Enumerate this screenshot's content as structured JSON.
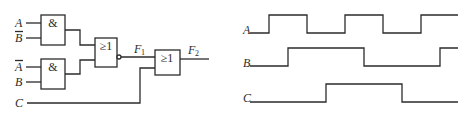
{
  "circuit": {
    "inputs": {
      "and1_top": {
        "label": "A",
        "inverted": false
      },
      "and1_bottom": {
        "label": "B",
        "inverted": true
      },
      "and2_top": {
        "label": "A",
        "inverted": true
      },
      "and2_bottom": {
        "label": "B",
        "inverted": false
      },
      "c_input": {
        "label": "C",
        "inverted": false
      }
    },
    "gates": {
      "and1": {
        "symbol": "&"
      },
      "and2": {
        "symbol": "&"
      },
      "nor": {
        "symbol": "≥1",
        "output_inverted": true
      },
      "or": {
        "symbol": "≥1"
      }
    },
    "outputs": {
      "f1": {
        "label": "F",
        "subscript": "1"
      },
      "f2": {
        "label": "F",
        "subscript": "2"
      }
    }
  },
  "waveforms": {
    "signals": [
      {
        "label": "A",
        "transitions_x": [
          269,
          307,
          345,
          383,
          421
        ],
        "initial": "low"
      },
      {
        "label": "B",
        "transitions_x": [
          288,
          364,
          440
        ],
        "initial": "low"
      },
      {
        "label": "C",
        "transitions_x": [
          326,
          402
        ],
        "initial": "low"
      }
    ]
  }
}
